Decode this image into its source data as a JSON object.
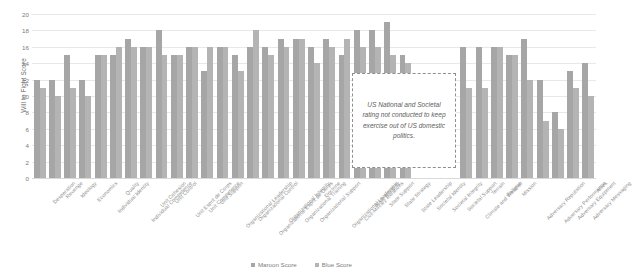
{
  "chart_data": {
    "type": "bar",
    "title": "",
    "xlabel": "",
    "ylabel": "Will to Fight Score",
    "ylim": [
      0,
      20
    ],
    "ytick_step": 2,
    "yticks": [
      0,
      2,
      4,
      6,
      8,
      10,
      12,
      14,
      16,
      18,
      20
    ],
    "grid": true,
    "legend_position": "bottom-right",
    "categories": [
      "Desperation",
      "Revenge",
      "Ideology",
      "Economics",
      "Individual Identity",
      "Quality",
      "Individual Competence",
      "Unit Cohesion",
      "Unit Control",
      "Unit Esprit de Corps",
      "Unit Competence",
      "Unit Support",
      "Organizational Leadership",
      "Organizational Control",
      "Organizational Esprit de Corps",
      "Organizational Integrity",
      "Organizational Training",
      "Organizational Support",
      "Doctrine",
      "Organizational Leadership",
      "Civil-Military Relations",
      "State Integrity",
      "State Support",
      "State Strategy",
      "State Leadership",
      "Societal Identity",
      "Societal Integrity",
      "Societal Support",
      "Climate and Weather",
      "Terrain",
      "Fatigue",
      "Mission",
      "Adversary Reputation",
      "Adversary Performance",
      "Adversary Equipment",
      "Adversary Messaging",
      "Allies"
    ],
    "series": [
      {
        "name": "Maroon Score",
        "color": "#a6a6a6",
        "values": [
          12,
          12,
          15,
          12,
          15,
          15,
          17,
          16,
          18,
          15,
          16,
          13,
          16,
          15,
          16,
          16,
          17,
          17,
          16,
          17,
          15,
          18,
          18,
          19,
          15,
          null,
          null,
          null,
          16,
          16,
          16,
          15,
          17,
          12,
          8,
          13,
          14
        ]
      },
      {
        "name": "Blue Score",
        "color": "#b4b4b4",
        "values": [
          11,
          10,
          11,
          10,
          15,
          16,
          16,
          16,
          15,
          15,
          16,
          16,
          16,
          13,
          18,
          15,
          16,
          17,
          14,
          16,
          17,
          16,
          16,
          15,
          14,
          null,
          null,
          null,
          11,
          11,
          16,
          15,
          12,
          7,
          6,
          11,
          10
        ]
      }
    ],
    "annotation": {
      "text": "US National and Societal rating not conducted to keep exercise out of US domestic politics.",
      "style": "dashed-box",
      "covers_categories": [
        "Societal Identity",
        "Societal Integrity",
        "Societal Support"
      ]
    }
  },
  "axis": {
    "y_title": "Will to Fight Score"
  },
  "legend": {
    "items": [
      {
        "label": "Maroon Score",
        "color": "#a6a6a6",
        "marker": "square-swatch"
      },
      {
        "label": "Blue Score",
        "color": "#b4b4b4",
        "marker": "square-swatch"
      }
    ]
  }
}
